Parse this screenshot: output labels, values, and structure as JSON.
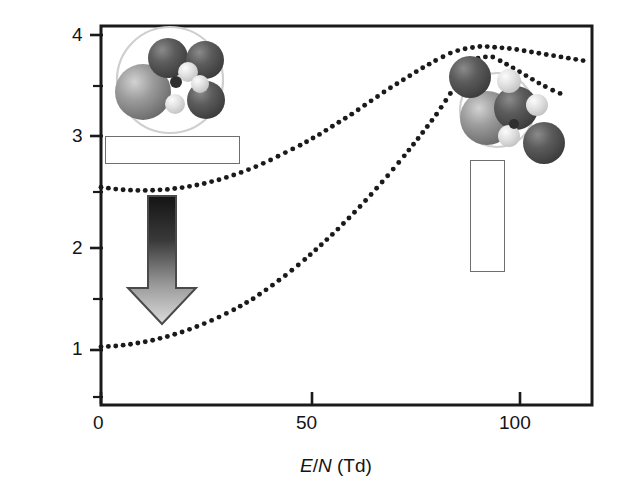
{
  "figure": {
    "type": "scientific-plot",
    "background": "#ffffff",
    "frame_color": "#1a1a1a"
  },
  "axes": {
    "y_label": "Mobility (a.u.)",
    "x_label_pre": "E",
    "x_label_slash": "/",
    "x_label_n": "N",
    "x_label_unit": " (Td)",
    "x_label_full": "E/N (Td)",
    "x_ticks": [
      {
        "value": 0,
        "label": "0"
      },
      {
        "value": 50,
        "label": "50"
      },
      {
        "value": 100,
        "label": "100"
      }
    ],
    "y_ticks": [
      {
        "value": 1,
        "label": "1"
      },
      {
        "value": 2,
        "label": "2"
      },
      {
        "value": 3,
        "label": "3"
      },
      {
        "value": 4,
        "label": "4"
      }
    ],
    "y_minor_ticks": [
      0.5,
      1.5,
      2.5,
      3.5
    ],
    "xlim": [
      0,
      117
    ],
    "ylim": [
      0.46,
      4.15
    ],
    "grid": false
  },
  "chart_data": {
    "type": "scatter",
    "title": "",
    "xlabel": "E/N (Td)",
    "ylabel": "Mobility (a.u.)",
    "xlim": [
      0,
      117
    ],
    "ylim": [
      0.46,
      4.15
    ],
    "grid": false,
    "legend": "none",
    "marker": "dotted",
    "series": [
      {
        "name": "upper-curve",
        "style": "dotted",
        "color": "#1a1a1a",
        "x": [
          0,
          4,
          8,
          12,
          16,
          20,
          24,
          28,
          32,
          36,
          40,
          44,
          48,
          52,
          56,
          60,
          64,
          68,
          72,
          76,
          80,
          84,
          87,
          90,
          92,
          95,
          98,
          101,
          104,
          107,
          110,
          113,
          116
        ],
        "y": [
          2.55,
          2.53,
          2.52,
          2.52,
          2.53,
          2.55,
          2.58,
          2.62,
          2.67,
          2.73,
          2.8,
          2.88,
          2.96,
          3.05,
          3.15,
          3.25,
          3.36,
          3.47,
          3.57,
          3.67,
          3.76,
          3.84,
          3.87,
          3.89,
          3.89,
          3.88,
          3.87,
          3.85,
          3.83,
          3.81,
          3.79,
          3.77,
          3.75
        ]
      },
      {
        "name": "lower-curve",
        "style": "dotted",
        "color": "#1a1a1a",
        "x": [
          0,
          4,
          8,
          12,
          16,
          20,
          24,
          28,
          32,
          36,
          40,
          44,
          48,
          52,
          56,
          60,
          64,
          68,
          72,
          76,
          80,
          84,
          87,
          90,
          93,
          96,
          99,
          102,
          105,
          108,
          111
        ],
        "y": [
          1.03,
          1.04,
          1.06,
          1.09,
          1.13,
          1.18,
          1.24,
          1.31,
          1.39,
          1.48,
          1.59,
          1.71,
          1.84,
          1.98,
          2.13,
          2.29,
          2.46,
          2.64,
          2.83,
          3.03,
          3.24,
          3.48,
          3.63,
          3.78,
          3.8,
          3.74,
          3.67,
          3.6,
          3.53,
          3.47,
          3.42
        ]
      }
    ]
  },
  "annotations": {
    "left_box": {
      "name": "left-caption-box",
      "text": "",
      "fill": "#ffffff",
      "border": "#6e6e6e"
    },
    "right_box": {
      "name": "right-caption-box",
      "text": "",
      "fill": "#ffffff",
      "border": "#6e6e6e"
    },
    "arrow": {
      "name": "down-arrow",
      "direction": "down",
      "gradient_from": "#1c1c1c",
      "gradient_to": "#d8d8d8",
      "outline": "#555555"
    },
    "cluster_left": {
      "name": "clustered-ion-illustration",
      "description": "ion solvated by cluster shell",
      "shell_color": "#d9d9d9",
      "spheres": [
        "large-gray",
        "dark-gray",
        "dark-gray",
        "dark-gray",
        "light-small",
        "light-small",
        "core-dark"
      ]
    },
    "cluster_right": {
      "name": "dissociated-ion-illustration",
      "description": "ion with cluster partially dissociated",
      "shell_color": "#d9d9d9",
      "spheres": [
        "large-gray",
        "dark-gray",
        "dark-gray",
        "dark-gray",
        "light-small",
        "light-small",
        "core-dark"
      ]
    }
  }
}
